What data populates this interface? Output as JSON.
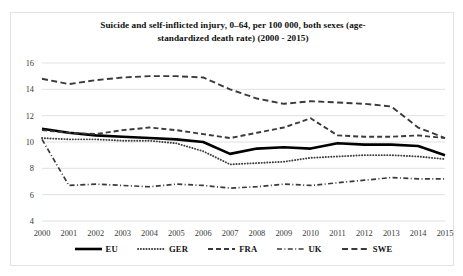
{
  "chart_data": {
    "type": "line",
    "title_line1": "Suicide and self-inflicted injury, 0–64, per 100 000, both sexes (age-",
    "title_line2": "standardized death rate) (2000 - 2015)",
    "xlabel": "",
    "ylabel": "",
    "xlim": [
      2000,
      2015
    ],
    "ylim": [
      4,
      16
    ],
    "ytick_step": 2,
    "grid": true,
    "grid_axis": "y",
    "legend_position": "bottom",
    "categories": [
      "2000",
      "2001",
      "2002",
      "2003",
      "2004",
      "2005",
      "2006",
      "2007",
      "2008",
      "2009",
      "2010",
      "2011",
      "2012",
      "2013",
      "2014",
      "2015"
    ],
    "yticks": [
      "4",
      "6",
      "8",
      "10",
      "12",
      "14",
      "16"
    ],
    "series": [
      {
        "name": "EU",
        "style": "solid-thick",
        "color": "#000000",
        "values": [
          11.0,
          10.7,
          10.5,
          10.4,
          10.3,
          10.2,
          10.0,
          9.1,
          9.5,
          9.6,
          9.5,
          9.9,
          9.8,
          9.8,
          9.7,
          9.0
        ]
      },
      {
        "name": "GER",
        "style": "dotted",
        "color": "#3f3f3f",
        "values": [
          10.3,
          10.2,
          10.2,
          10.1,
          10.1,
          9.9,
          9.3,
          8.3,
          8.4,
          8.5,
          8.8,
          8.9,
          9.0,
          9.0,
          8.9,
          8.7
        ]
      },
      {
        "name": "FRA",
        "style": "dashed",
        "color": "#3a3a3a",
        "values": [
          10.9,
          10.7,
          10.6,
          10.9,
          11.1,
          10.9,
          10.6,
          10.3,
          10.7,
          11.1,
          11.8,
          10.5,
          10.4,
          10.4,
          10.5,
          10.3
        ]
      },
      {
        "name": "UK",
        "style": "dash-dot",
        "color": "#3a3a3a",
        "values": [
          10.2,
          6.7,
          6.8,
          6.7,
          6.6,
          6.8,
          6.7,
          6.5,
          6.6,
          6.8,
          6.7,
          6.9,
          7.1,
          7.3,
          7.2,
          7.2
        ]
      },
      {
        "name": "SWE",
        "style": "long-dash",
        "color": "#3a3a3a",
        "values": [
          14.8,
          14.4,
          14.7,
          14.9,
          15.0,
          15.0,
          14.9,
          14.0,
          13.3,
          12.9,
          13.1,
          13.0,
          12.9,
          12.7,
          11.1,
          10.3
        ]
      }
    ]
  },
  "legend": {
    "items": [
      {
        "label": "EU",
        "swatch": "solid-thick-swatch"
      },
      {
        "label": "GER",
        "swatch": "dotted-swatch"
      },
      {
        "label": "FRA",
        "swatch": "dashed-swatch"
      },
      {
        "label": "UK",
        "swatch": "dash-dot-swatch"
      },
      {
        "label": "SWE",
        "swatch": "long-dash-swatch"
      }
    ]
  }
}
